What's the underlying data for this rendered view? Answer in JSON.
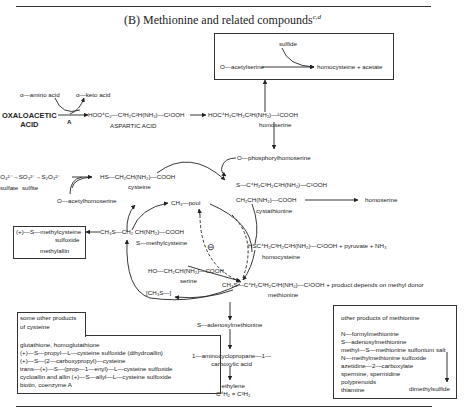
{
  "title": {
    "text": "(B) Methionine and related compounds",
    "sup": "c,d"
  },
  "top_box": {
    "sulfide": "sulfide",
    "o_acetylserine": "O—acetylserine",
    "product": "homocysteine + acetate"
  },
  "transamination": {
    "amino": "α—amino acid",
    "keto": "α—keto acid",
    "enzyme": "A"
  },
  "oxaloacetic": {
    "line1": "OXALOACETIC",
    "line2": "ACID"
  },
  "aspartic": {
    "formula": "HOO⁴C₂—C³H₂C²H(NH₂)—C¹OOH",
    "name": "ASPARTIC ACID"
  },
  "homoserine": {
    "formula": "HOC⁴H₂C³H₂C²H(NH₂)—¹COOH",
    "name": "homoserine"
  },
  "phosphoryl": "O—phosphorylhomoserine",
  "sulfate_chain": {
    "formula": "SO₄²⁻→SO₃²⁻→S₂O₃²⁻",
    "sulfate": "sulfate",
    "sulfite": "sulfite"
  },
  "cysteine": {
    "formula": "HS—CH₂CH(NH₂)—COOH",
    "name": "cysteine"
  },
  "o_acetylhomoserine": "O—acetylhomoserine",
  "cystathionine": {
    "line1": "S—C⁴H₂C³H₂C²H(NH₂)—C¹OOH",
    "line2": "CH₂CH(NH₂)—COOH",
    "name": "cystathionine",
    "product": "homoserine"
  },
  "ch3_pool": "CH₃—pool",
  "inhibit": "⊖",
  "methylcysteine": {
    "formula": "CH₃S—CH₂ CH(NH₂)—COOH",
    "name": "S—methylcysteine"
  },
  "methylcysteine_box": {
    "line1": "(+)—S—methylcysteine",
    "line2": "sulfoxide",
    "line3": "methylallin"
  },
  "homocysteine": {
    "formula": "HSC⁴H₂C³H₂C²H(NH₂)—C¹OOH + pyruvate + NH₃",
    "name": "homocysteine"
  },
  "serine": {
    "formula": "HO—CH₂CH(NH₂)—COOH",
    "name": "serine"
  },
  "ch3s": "[CH₃S—]",
  "methionine": {
    "formula": "CH₃S—C⁴H₂C³H₂C²H(NH₂)—C¹OOH + product depends on methyl donor",
    "name": "methionine"
  },
  "sam": "S—adenosylmethionine",
  "acc": {
    "line1": "1—aminocyclopropane—1—",
    "line2": "carboxylic acid"
  },
  "ethylene": {
    "name": "ethylene",
    "formula": "C⁴H₂ = C³H₂"
  },
  "cysteine_box": {
    "header1": "some other products",
    "header2": "of cysteine",
    "items": [
      "glutathione, homoglutathione",
      "(+)—S—propyl—L—cysteine sulfoxide (dihydroallin)",
      "(+)—S—(2—carboxypropyl)—cysteine",
      "trans—(+)—S—(prop—1—enyl)—L—cysteine sulfoxide",
      "cycloallin and allin (+)—S—allyl—L—cysteine sulfoxide",
      "biotin, coenzyme A"
    ]
  },
  "methionine_box": {
    "header": "other products of methionine",
    "items": [
      "N—formylmethionine",
      "S—adenosylmethionine",
      "methyl—S—methionine sulfonium salt",
      "N—methylmethionine sulfoxide",
      "azetidine—2—carboxylate",
      "spermine, spermidine",
      "polyprenoids",
      "thiamine"
    ],
    "dms": "dimethylsulfide"
  }
}
